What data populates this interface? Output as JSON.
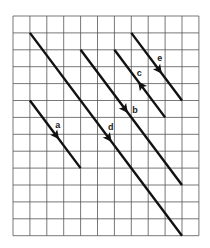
{
  "diagram": {
    "grid": {
      "columns": 11,
      "rows": 13
    },
    "colors": {
      "grid": "#555555",
      "vector": "#111111",
      "label": "#222222"
    },
    "vectors": [
      {
        "label": "a",
        "start": [
          1,
          5
        ],
        "end": [
          4,
          9
        ],
        "arrow_at": 0.52,
        "direction": "forward"
      },
      {
        "label": "b",
        "start": [
          4,
          2
        ],
        "end": [
          10,
          10
        ],
        "arrow_at": 0.44,
        "direction": "forward"
      },
      {
        "label": "c",
        "start": [
          6,
          2
        ],
        "end": [
          9,
          6
        ],
        "arrow_at": 0.52,
        "direction": "backward"
      },
      {
        "label": "d",
        "start": [
          1,
          1
        ],
        "end": [
          10,
          13
        ],
        "arrow_at": 0.52,
        "direction": "forward"
      },
      {
        "label": "e",
        "start": [
          7,
          1
        ],
        "end": [
          10,
          5
        ],
        "arrow_at": 0.55,
        "direction": "forward"
      }
    ]
  }
}
